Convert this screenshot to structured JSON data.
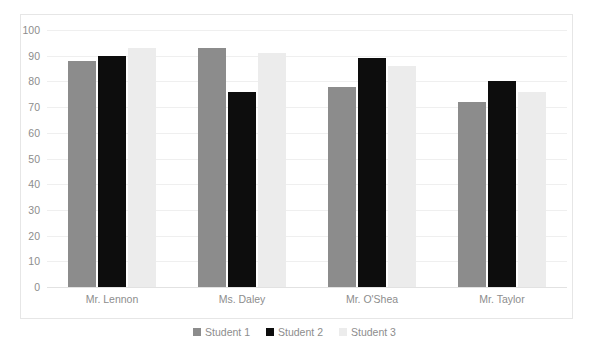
{
  "chart_data": {
    "type": "bar",
    "title": "",
    "xlabel": "",
    "ylabel": "",
    "ylim": [
      0,
      100
    ],
    "yticks": [
      100,
      90,
      80,
      70,
      60,
      50,
      40,
      30,
      20,
      10,
      0
    ],
    "grid": true,
    "legend_position": "bottom",
    "categories": [
      "Mr. Lennon",
      "Ms. Daley",
      "Mr. O'Shea",
      "Mr. Taylor"
    ],
    "series": [
      {
        "name": "Student 1",
        "color": "#8c8c8c",
        "values": [
          88,
          93,
          78,
          72
        ]
      },
      {
        "name": "Student 2",
        "color": "#0d0d0d",
        "values": [
          90,
          76,
          89,
          80
        ]
      },
      {
        "name": "Student 3",
        "color": "#ececec",
        "values": [
          93,
          91,
          86,
          76
        ]
      }
    ]
  },
  "colors": {
    "series1": "#8c8c8c",
    "series2": "#0d0d0d",
    "series3": "#ececec",
    "gridline": "#efefef",
    "frame": "#e6e6e6",
    "tick_text": "#8d8d8d",
    "background": "#ffffff"
  }
}
